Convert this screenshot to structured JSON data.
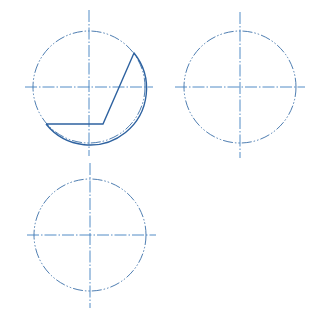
{
  "drawing": {
    "type": "technical-sketch",
    "colors": {
      "centerline": "#3f7fbf",
      "phantom": "#3b6fa8",
      "solid": "#2e62a0",
      "background": "#ffffff"
    },
    "views": [
      {
        "name": "view-top-left",
        "circle": {
          "cx": 89,
          "cy": 87,
          "r": 56
        },
        "vertical_axis": {
          "x": 89,
          "y1": 10,
          "y2": 156
        },
        "horizontal_axis": {
          "y": 87,
          "x1": 25,
          "x2": 153
        },
        "profile": {
          "polyline": [
            [
              46,
              124
            ],
            [
              103,
              124
            ],
            [
              134,
              53
            ]
          ],
          "arc": {
            "from": [
              134,
              53
            ],
            "to": [
              46,
              124
            ],
            "r": 56
          }
        }
      },
      {
        "name": "view-top-right",
        "circle": {
          "cx": 240,
          "cy": 87,
          "r": 56
        },
        "vertical_axis": {
          "x": 240,
          "y1": 12,
          "y2": 158
        },
        "horizontal_axis": {
          "y": 87,
          "x1": 175,
          "x2": 305
        }
      },
      {
        "name": "view-bottom-left",
        "circle": {
          "cx": 90,
          "cy": 235,
          "r": 56
        },
        "vertical_axis": {
          "x": 90,
          "y1": 163,
          "y2": 308
        },
        "horizontal_axis": {
          "y": 235,
          "x1": 27,
          "x2": 156
        }
      }
    ]
  }
}
